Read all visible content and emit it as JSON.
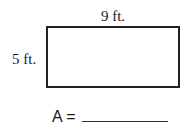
{
  "figure": {
    "shape": "rectangle",
    "width_label": "9 ft.",
    "height_label": "5 ft.",
    "border_color": "#222222"
  },
  "answer": {
    "prompt": "A =",
    "blank": ""
  }
}
